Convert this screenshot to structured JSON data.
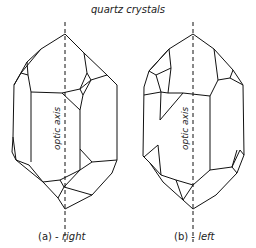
{
  "title": "quartz crystals",
  "crystals": [
    {
      "id": "a",
      "prefix": "(a) - ",
      "handedness": "right",
      "axis_label": "optic axis"
    },
    {
      "id": "b",
      "prefix": "(b) - ",
      "handedness": "left",
      "axis_label": "optic axis"
    }
  ],
  "colors": {
    "line": "#111111",
    "background": "#ffffff"
  }
}
